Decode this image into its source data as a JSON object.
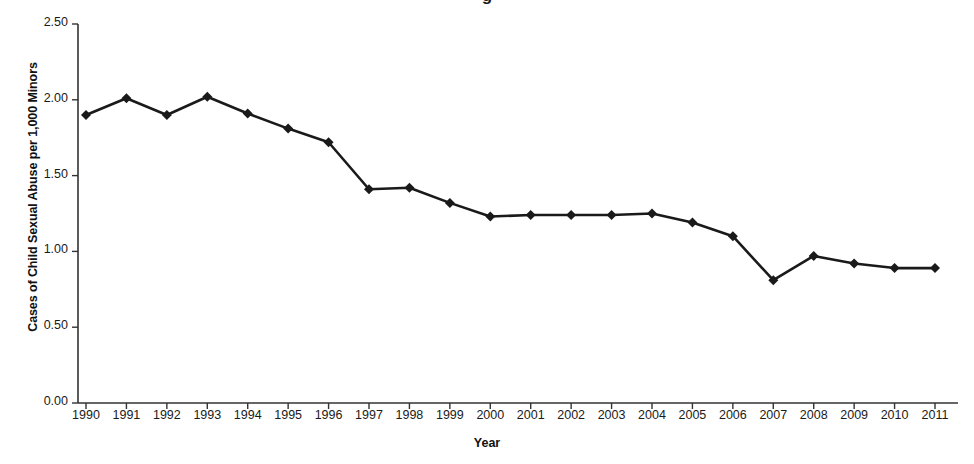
{
  "figure": {
    "cropped_title_fragment": "g",
    "background_color": "#ffffff",
    "line_color": "#1a1a1a",
    "marker_color": "#1a1a1a",
    "axis_color": "#333333"
  },
  "chart_data": {
    "type": "line",
    "title": "",
    "xlabel": "Year",
    "ylabel": "Cases of Child Sexual Abuse per 1,000 Minors",
    "categories": [
      "1990",
      "1991",
      "1992",
      "1993",
      "1994",
      "1995",
      "1996",
      "1997",
      "1998",
      "1999",
      "2000",
      "2001",
      "2002",
      "2003",
      "2004",
      "2005",
      "2006",
      "2007",
      "2008",
      "2009",
      "2010",
      "2011"
    ],
    "values": [
      1.9,
      2.01,
      1.9,
      2.02,
      1.91,
      1.81,
      1.72,
      1.41,
      1.42,
      1.32,
      1.23,
      1.24,
      1.24,
      1.24,
      1.25,
      1.19,
      1.1,
      0.81,
      0.97,
      0.92,
      0.89,
      0.89
    ],
    "ylim": [
      0.0,
      2.5
    ],
    "ytick_labels": [
      "0.00",
      "0.50",
      "1.00",
      "1.50",
      "2.00",
      "2.50"
    ],
    "ytick_values": [
      0.0,
      0.5,
      1.0,
      1.5,
      2.0,
      2.5
    ],
    "grid": false,
    "legend": false,
    "marker": "diamond"
  }
}
